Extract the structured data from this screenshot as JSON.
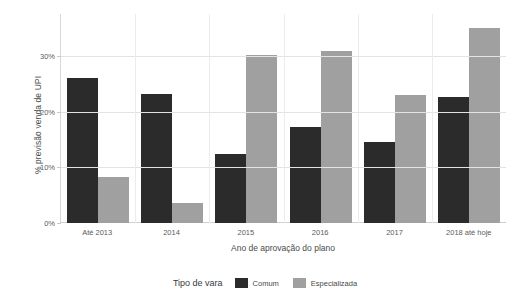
{
  "chart_data": {
    "type": "bar",
    "title": "",
    "xlabel": "Ano de aprovação do plano",
    "ylabel": "% previsão venda de UPI",
    "categories": [
      "Até 2013",
      "2014",
      "2015",
      "2016",
      "2017",
      "2018 até hoje"
    ],
    "series": [
      {
        "name": "Comum",
        "color": "#2b2b2b",
        "values": [
          26.1,
          23.2,
          12.4,
          17.3,
          14.6,
          22.7
        ]
      },
      {
        "name": "Especializada",
        "color": "#a0a0a0",
        "values": [
          8.3,
          3.6,
          30.3,
          31.0,
          23.1,
          35.1
        ]
      }
    ],
    "ylim": [
      0,
      37.6
    ],
    "yticks": [
      0,
      10,
      20,
      30
    ],
    "ytick_labels": [
      "0%",
      "10%",
      "20%",
      "30%"
    ],
    "grid": {
      "horizontal": true,
      "vertical": true
    },
    "legend": {
      "title": "Tipo de vara",
      "position": "bottom",
      "entries": [
        {
          "label": "Comum",
          "color": "#2b2b2b"
        },
        {
          "label": "Especializada",
          "color": "#a0a0a0"
        }
      ]
    },
    "background_color": "#ffffff",
    "grid_color": "#e3e3e3"
  }
}
